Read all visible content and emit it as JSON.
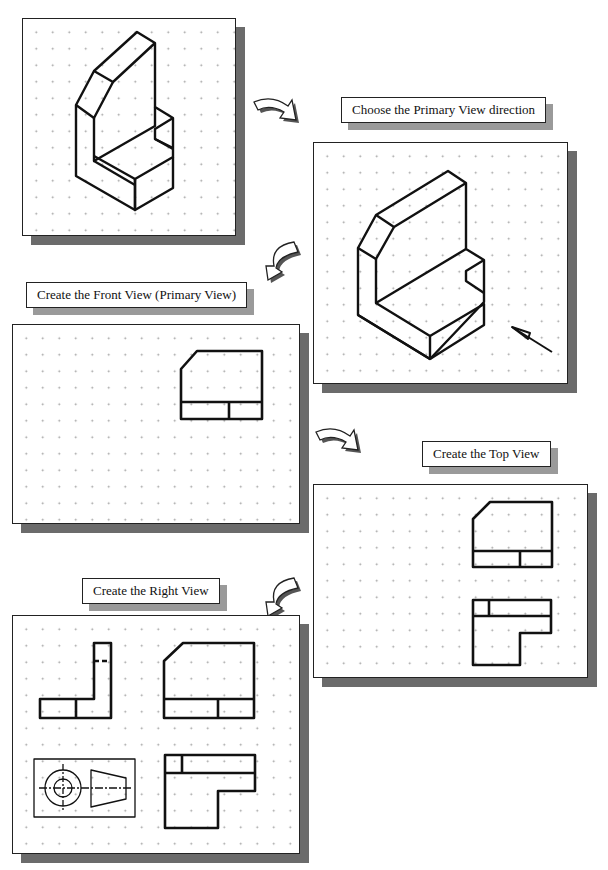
{
  "steps": [
    {
      "id": "isometric",
      "label": ""
    },
    {
      "id": "primary-direction",
      "label": "Choose the Primary View direction"
    },
    {
      "id": "front-view",
      "label": "Create the Front View (Primary View)"
    },
    {
      "id": "top-view",
      "label": "Create the Top View"
    },
    {
      "id": "right-view",
      "label": "Create the Right View"
    }
  ],
  "colors": {
    "line": "#111111",
    "shadow": "#6b6b6b",
    "label_shadow": "#9a9a9a",
    "grid_dot": "#9a9a9a"
  },
  "icons": [
    "curved-arrow-right",
    "curved-arrow-left",
    "view-direction-arrow",
    "projection-symbol"
  ]
}
